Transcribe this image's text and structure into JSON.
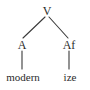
{
  "figure": {
    "kind": "syntax-tree",
    "background_color": "#ffffff",
    "text_color": "#2b2b2b",
    "line_color": "#3a3a3a",
    "width": 90,
    "height": 90
  },
  "tree": {
    "root": {
      "label": "V",
      "x": 47,
      "y": 11
    },
    "nonterminals": [
      {
        "id": "root",
        "label": "V",
        "x": 47,
        "y": 11
      },
      {
        "id": "left",
        "label": "A",
        "x": 22,
        "y": 45
      },
      {
        "id": "right",
        "label": "Af",
        "x": 69,
        "y": 45
      }
    ],
    "leaves": [
      {
        "id": "left-leaf",
        "label": "modern",
        "x": 23,
        "y": 77
      },
      {
        "id": "right-leaf",
        "label": "ize",
        "x": 70,
        "y": 77
      }
    ],
    "edges": [
      {
        "id": "root-to-left",
        "type": "branch",
        "x1": 45,
        "y1": 17,
        "x2": 23,
        "y2": 38
      },
      {
        "id": "root-to-right",
        "type": "branch",
        "x1": 49,
        "y1": 17,
        "x2": 68,
        "y2": 38
      },
      {
        "id": "left-to-leaf",
        "type": "stem",
        "x1": 22,
        "y1": 51,
        "x2": 22,
        "y2": 69
      },
      {
        "id": "right-to-leaf",
        "type": "stem",
        "x1": 69,
        "y1": 51,
        "x2": 69,
        "y2": 69
      }
    ]
  }
}
